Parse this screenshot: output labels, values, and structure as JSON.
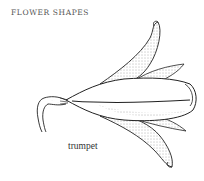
{
  "header": {
    "title": "FLOWER SHAPES"
  },
  "illustration": {
    "name": "trumpet-flower",
    "caption": "trumpet",
    "line_color": "#222222",
    "stipple_color": "#555555"
  }
}
